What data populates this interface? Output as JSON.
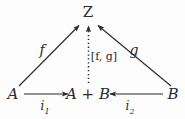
{
  "diagram": {
    "type": "commutative-diagram",
    "background_color": "#fdfdfd",
    "ink_color": "#2b2b2b",
    "nodes": [
      {
        "id": "Z",
        "label": "Z",
        "x": 88,
        "y": 12,
        "style": "upright"
      },
      {
        "id": "A",
        "label": "A",
        "x": 13,
        "y": 94,
        "style": "italic"
      },
      {
        "id": "AplusB",
        "label": "A + B",
        "x": 88,
        "y": 94,
        "style": "italic"
      },
      {
        "id": "B",
        "label": "B",
        "x": 173,
        "y": 94,
        "style": "italic"
      }
    ],
    "edges": [
      {
        "id": "f",
        "from": "A",
        "to": "Z",
        "label": "f",
        "label_x": 42,
        "label_y": 50,
        "line": "solid",
        "arrowhead": "to"
      },
      {
        "id": "g",
        "from": "B",
        "to": "Z",
        "label": "g",
        "label_x": 134,
        "label_y": 50,
        "line": "solid",
        "arrowhead": "to"
      },
      {
        "id": "mediating",
        "from": "AplusB",
        "to": "Z",
        "label": "[f, g]",
        "label_x": 104,
        "label_y": 56,
        "line": "dotted",
        "arrowhead": "to"
      },
      {
        "id": "i1",
        "from": "A",
        "to": "AplusB",
        "label_base": "i",
        "label_sub": "1",
        "label_x": 45,
        "label_y": 108,
        "line": "solid",
        "arrowhead": "to"
      },
      {
        "id": "i2",
        "from": "B",
        "to": "AplusB",
        "label_base": "i",
        "label_sub": "2",
        "label_x": 130,
        "label_y": 108,
        "line": "solid",
        "arrowhead": "to"
      }
    ]
  }
}
